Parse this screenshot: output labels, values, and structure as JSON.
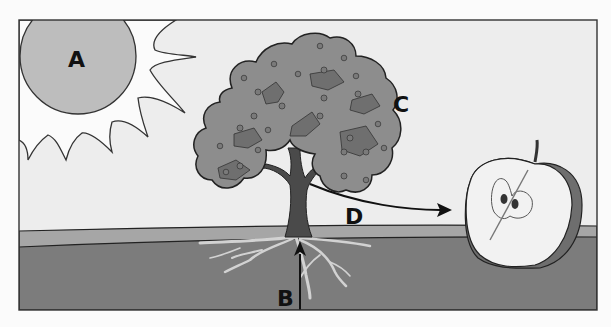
{
  "diagram": {
    "type": "labeled-illustration",
    "labels": {
      "A": "A",
      "B": "B",
      "C": "C",
      "D": "D"
    },
    "parts": [
      {
        "label": "A",
        "depicts": "sun"
      },
      {
        "label": "B",
        "depicts": "arrow pointing up from roots into trunk"
      },
      {
        "label": "C",
        "depicts": "tree canopy with fruit"
      },
      {
        "label": "D",
        "depicts": "arrow from tree to cut apple"
      }
    ],
    "colors": {
      "sky": "#ededed",
      "sun": "#bdbdbd",
      "canopy": "#8d8d8d",
      "trunk": "#4a4a4a",
      "ground_band": "#a6a6a6",
      "soil": "#7c7c7c",
      "roots": "#d2d2d2",
      "apple_flesh": "#f2f2f2",
      "apple_skin": "#6e6e6e",
      "outline": "#222222"
    }
  }
}
